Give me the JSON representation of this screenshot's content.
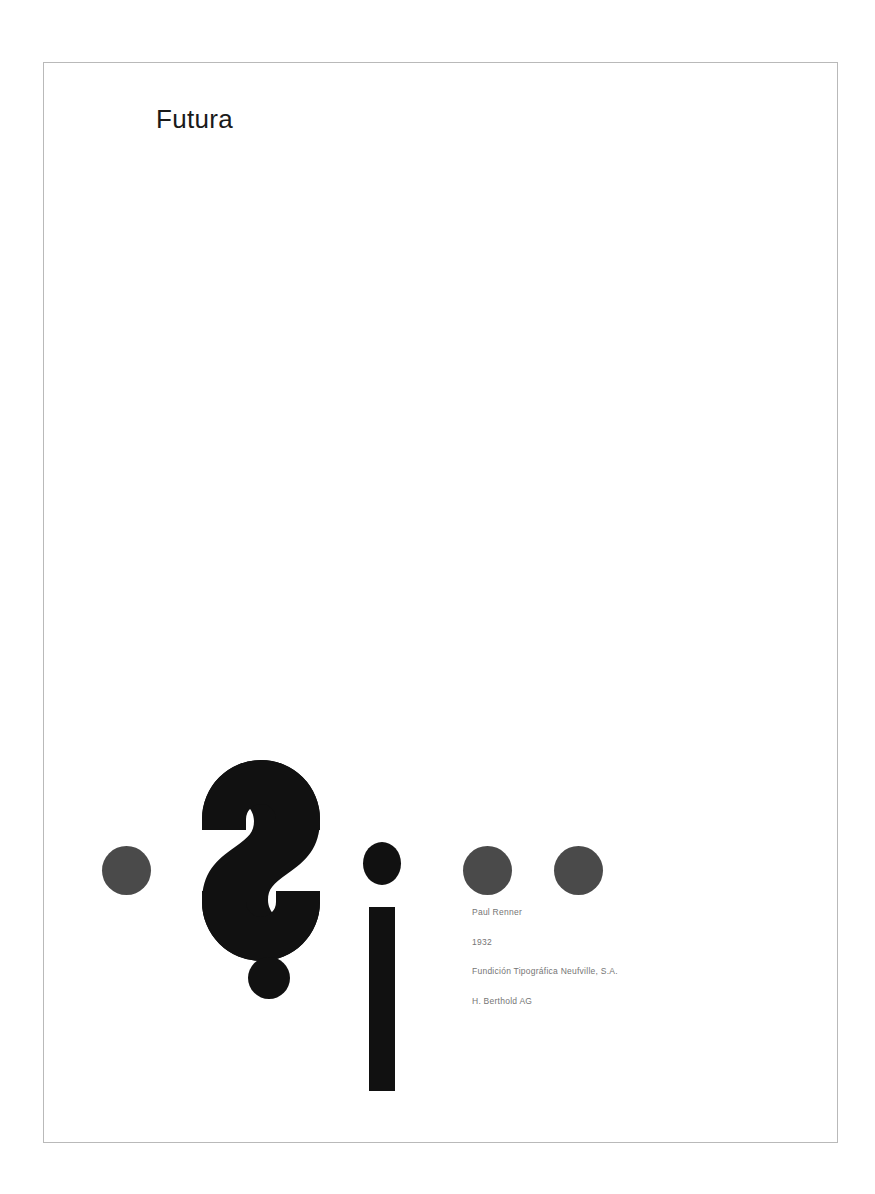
{
  "poster": {
    "title": "Futura",
    "typeface_specimen": {
      "primary_glyph": "¿",
      "secondary_glyph": "i",
      "glyph_pair": "¿i"
    },
    "metadata": [
      {
        "label": "Paul Renner"
      },
      {
        "label": "1932"
      },
      {
        "label": "Fundición Tipográfica Neufville, S.A."
      },
      {
        "label": "H. Berthold AG"
      }
    ],
    "ornaments": {
      "dot_count": 3,
      "dot_color": "#4a4a4a"
    },
    "colors": {
      "background": "#ffffff",
      "frame_border": "#b9b9b9",
      "glyph_black": "#111111",
      "title_text": "#1a1a1a",
      "metadata_text": "#757575",
      "ornament_gray": "#4a4a4a"
    }
  }
}
